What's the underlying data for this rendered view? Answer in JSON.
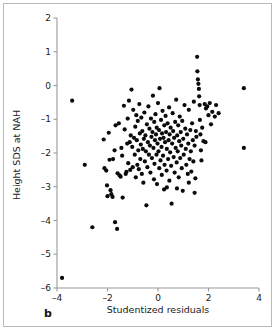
{
  "figure": {
    "panel_label": "b",
    "frame_color": "#b9b9b9",
    "background_color": "#ffffff"
  },
  "chart_data": {
    "type": "scatter",
    "title": "",
    "subtitle": "",
    "xlabel": "Studentized residuals",
    "ylabel": "Height SDS at NAH",
    "xlim": [
      -4,
      4
    ],
    "ylim": [
      -6,
      2
    ],
    "xticks": [
      -4,
      -2,
      0,
      2,
      4
    ],
    "xticklabels": [
      "–4",
      "–2",
      "0",
      "2",
      "4"
    ],
    "yticks": [
      2,
      1,
      0,
      -1,
      -2,
      -3,
      -4,
      -5,
      -6
    ],
    "yticklabels": [
      "2",
      "1",
      "0",
      "–1",
      "–2",
      "–3",
      "–4",
      "–5",
      "–6"
    ],
    "grid": false,
    "legend": null,
    "marker": {
      "shape": "circle",
      "color": "#0b0b0b",
      "size_px": 3.1
    },
    "series": [
      {
        "name": "Subjects",
        "color": "#0b0b0b",
        "n_points": 196,
        "points": [
          [
            -3.8,
            -5.7
          ],
          [
            -3.4,
            -0.45
          ],
          [
            -2.9,
            -2.35
          ],
          [
            -2.6,
            -4.2
          ],
          [
            -2.15,
            -1.6
          ],
          [
            -2.12,
            -2.45
          ],
          [
            -2.05,
            -2.52
          ],
          [
            -2.02,
            -2.96
          ],
          [
            -2.0,
            -3.28
          ],
          [
            -1.95,
            -1.4
          ],
          [
            -1.92,
            -2.2
          ],
          [
            -1.88,
            -3.1
          ],
          [
            -1.85,
            -3.22
          ],
          [
            -1.8,
            -3.3
          ],
          [
            -1.78,
            -2.18
          ],
          [
            -1.72,
            -1.92
          ],
          [
            -1.7,
            -4.05
          ],
          [
            -1.68,
            -1.18
          ],
          [
            -1.62,
            -4.25
          ],
          [
            -1.6,
            -2.6
          ],
          [
            -1.55,
            -1.12
          ],
          [
            -1.52,
            -2.66
          ],
          [
            -1.48,
            -2.7
          ],
          [
            -1.45,
            -1.85
          ],
          [
            -1.42,
            -2.08
          ],
          [
            -1.4,
            -3.32
          ],
          [
            -1.35,
            -0.6
          ],
          [
            -1.32,
            -1.3
          ],
          [
            -1.28,
            -2.62
          ],
          [
            -1.25,
            -2.56
          ],
          [
            -1.22,
            -1.72
          ],
          [
            -1.2,
            -0.98
          ],
          [
            -1.18,
            -2.3
          ],
          [
            -1.15,
            -0.45
          ],
          [
            -1.12,
            -1.68
          ],
          [
            -1.1,
            -2.5
          ],
          [
            -1.08,
            -1.48
          ],
          [
            -1.05,
            -0.12
          ],
          [
            -1.02,
            -1.82
          ],
          [
            -1.0,
            -2.42
          ],
          [
            -0.98,
            -0.72
          ],
          [
            -0.95,
            -1.55
          ],
          [
            -0.92,
            -2.05
          ],
          [
            -0.9,
            -1.22
          ],
          [
            -0.88,
            -2.72
          ],
          [
            -0.86,
            -0.88
          ],
          [
            -0.84,
            -1.62
          ],
          [
            -0.82,
            -2.35
          ],
          [
            -0.8,
            -1.05
          ],
          [
            -0.78,
            -1.92
          ],
          [
            -0.76,
            -2.48
          ],
          [
            -0.74,
            -0.55
          ],
          [
            -0.72,
            -1.42
          ],
          [
            -0.7,
            -2.18
          ],
          [
            -0.68,
            -1.75
          ],
          [
            -0.66,
            -0.95
          ],
          [
            -0.64,
            -2.62
          ],
          [
            -0.62,
            -1.35
          ],
          [
            -0.6,
            -1.88
          ],
          [
            -0.58,
            -2.88
          ],
          [
            -0.56,
            -1.58
          ],
          [
            -0.54,
            -0.8
          ],
          [
            -0.52,
            -2.25
          ],
          [
            -0.5,
            -1.48
          ],
          [
            -0.48,
            -1.95
          ],
          [
            -0.46,
            -3.55
          ],
          [
            -0.44,
            -1.15
          ],
          [
            -0.42,
            -2.42
          ],
          [
            -0.4,
            -1.68
          ],
          [
            -0.38,
            -0.62
          ],
          [
            -0.36,
            -2.05
          ],
          [
            -0.34,
            -1.28
          ],
          [
            -0.32,
            -1.78
          ],
          [
            -0.3,
            -2.58
          ],
          [
            -0.28,
            -0.98
          ],
          [
            -0.26,
            -1.52
          ],
          [
            -0.24,
            -2.15
          ],
          [
            -0.22,
            -1.38
          ],
          [
            -0.2,
            -0.3
          ],
          [
            -0.18,
            -1.85
          ],
          [
            -0.16,
            -2.78
          ],
          [
            -0.15,
            -1.08
          ],
          [
            -0.14,
            -2.32
          ],
          [
            -0.12,
            -1.62
          ],
          [
            -0.1,
            -0.85
          ],
          [
            -0.08,
            -1.45
          ],
          [
            -0.06,
            -2.05
          ],
          [
            -0.05,
            -1.25
          ],
          [
            -0.04,
            -2.92
          ],
          [
            -0.02,
            -1.72
          ],
          [
            0.0,
            -0.52
          ],
          [
            0.02,
            -1.95
          ],
          [
            0.04,
            -1.32
          ],
          [
            0.05,
            -2.45
          ],
          [
            0.06,
            -0.08
          ],
          [
            0.08,
            -1.58
          ],
          [
            0.1,
            -2.22
          ],
          [
            0.12,
            -1.02
          ],
          [
            0.14,
            -1.82
          ],
          [
            0.15,
            -2.65
          ],
          [
            0.16,
            -1.42
          ],
          [
            0.18,
            -0.75
          ],
          [
            0.2,
            -2.08
          ],
          [
            0.22,
            -1.55
          ],
          [
            0.24,
            -3.08
          ],
          [
            0.25,
            -1.18
          ],
          [
            0.26,
            -2.35
          ],
          [
            0.28,
            -1.68
          ],
          [
            0.3,
            -0.9
          ],
          [
            0.32,
            -1.38
          ],
          [
            0.34,
            -2.52
          ],
          [
            0.35,
            -1.88
          ],
          [
            0.38,
            -1.12
          ],
          [
            0.4,
            -2.18
          ],
          [
            0.42,
            -1.62
          ],
          [
            0.44,
            -0.65
          ],
          [
            0.45,
            -2.82
          ],
          [
            0.46,
            -1.45
          ],
          [
            0.48,
            -1.98
          ],
          [
            0.5,
            -1.25
          ],
          [
            0.52,
            -2.38
          ],
          [
            0.54,
            -3.5
          ],
          [
            0.56,
            -1.72
          ],
          [
            0.58,
            -0.82
          ],
          [
            0.6,
            -1.35
          ],
          [
            0.62,
            -2.12
          ],
          [
            0.64,
            -1.55
          ],
          [
            0.66,
            -2.58
          ],
          [
            0.68,
            -1.08
          ],
          [
            0.7,
            -1.85
          ],
          [
            0.72,
            -0.42
          ],
          [
            0.74,
            -2.28
          ],
          [
            0.76,
            -1.48
          ],
          [
            0.78,
            -1.95
          ],
          [
            0.8,
            -1.18
          ],
          [
            0.82,
            -2.72
          ],
          [
            0.84,
            -1.65
          ],
          [
            0.86,
            -0.92
          ],
          [
            0.88,
            -2.15
          ],
          [
            0.9,
            -1.38
          ],
          [
            0.92,
            -1.78
          ],
          [
            0.94,
            -2.45
          ],
          [
            0.96,
            -1.05
          ],
          [
            0.98,
            -3.12
          ],
          [
            1.0,
            -1.58
          ],
          [
            1.02,
            -2.05
          ],
          [
            1.05,
            -0.58
          ],
          [
            1.08,
            -1.28
          ],
          [
            1.1,
            -1.88
          ],
          [
            1.12,
            -2.35
          ],
          [
            1.15,
            -1.45
          ],
          [
            1.18,
            -2.62
          ],
          [
            1.2,
            -1.72
          ],
          [
            1.22,
            -0.72
          ],
          [
            1.25,
            -2.18
          ],
          [
            1.28,
            -1.32
          ],
          [
            1.3,
            -1.95
          ],
          [
            1.32,
            -2.55
          ],
          [
            1.35,
            -1.12
          ],
          [
            1.38,
            -1.62
          ],
          [
            1.4,
            -2.25
          ],
          [
            1.42,
            -0.48
          ],
          [
            1.45,
            -1.78
          ],
          [
            1.48,
            -2.75
          ],
          [
            1.5,
            -1.35
          ],
          [
            1.52,
            -1.52
          ],
          [
            1.55,
            0.85
          ],
          [
            1.56,
            0.42
          ],
          [
            1.58,
            0.18
          ],
          [
            1.6,
            0.05
          ],
          [
            1.62,
            -0.1
          ],
          [
            1.63,
            -0.32
          ],
          [
            1.65,
            -0.58
          ],
          [
            1.66,
            -1.02
          ],
          [
            1.68,
            -1.45
          ],
          [
            1.7,
            -1.92
          ],
          [
            1.72,
            -2.22
          ],
          [
            1.75,
            -1.25
          ],
          [
            1.8,
            -1.65
          ],
          [
            1.85,
            -0.55
          ],
          [
            1.88,
            -1.68
          ],
          [
            1.9,
            -0.68
          ],
          [
            1.95,
            -0.62
          ],
          [
            2.0,
            -0.88
          ],
          [
            2.05,
            -0.52
          ],
          [
            2.1,
            -1.15
          ],
          [
            2.15,
            -0.78
          ],
          [
            2.25,
            -0.92
          ],
          [
            2.3,
            -0.58
          ],
          [
            2.4,
            -0.82
          ],
          [
            1.45,
            -3.18
          ],
          [
            1.22,
            -2.88
          ],
          [
            0.75,
            -3.05
          ],
          [
            0.35,
            -3.02
          ],
          [
            3.4,
            -0.08
          ],
          [
            3.4,
            -1.85
          ]
        ]
      }
    ]
  },
  "axes_geometry": {
    "plot_left_px": 57,
    "plot_right_px": 259,
    "plot_top_px": 18,
    "plot_bottom_px": 288
  }
}
